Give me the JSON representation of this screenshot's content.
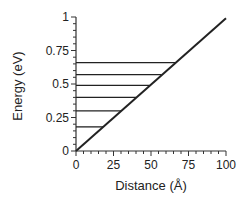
{
  "chart_data": {
    "type": "line",
    "title": "",
    "xlabel": "Distance (Å)",
    "ylabel": "Energy (eV)",
    "xlim": [
      0,
      100
    ],
    "ylim": [
      0,
      1
    ],
    "x_ticks": [
      0,
      25,
      50,
      75,
      100
    ],
    "x_tick_labels": [
      "0",
      "25",
      "50",
      "75",
      "100"
    ],
    "y_ticks": [
      0,
      0.25,
      0.5,
      0.75,
      1
    ],
    "y_tick_labels": [
      "0",
      "0.25",
      "0.5",
      "0.75",
      "1"
    ],
    "grid": false,
    "legend": null,
    "series": [
      {
        "name": "diagonal",
        "x": [
          0,
          100
        ],
        "y": [
          0,
          0.99
        ]
      }
    ],
    "energy_levels": [
      {
        "energy": 0.18,
        "x_start": 0,
        "x_end": 18
      },
      {
        "energy": 0.3,
        "x_start": 0,
        "x_end": 30
      },
      {
        "energy": 0.4,
        "x_start": 0,
        "x_end": 40
      },
      {
        "energy": 0.49,
        "x_start": 0,
        "x_end": 49
      },
      {
        "energy": 0.57,
        "x_start": 0,
        "x_end": 57
      },
      {
        "energy": 0.66,
        "x_start": 0,
        "x_end": 66
      }
    ],
    "colors": {
      "line": "#222222",
      "axis": "#333333",
      "background": "#ffffff"
    }
  }
}
